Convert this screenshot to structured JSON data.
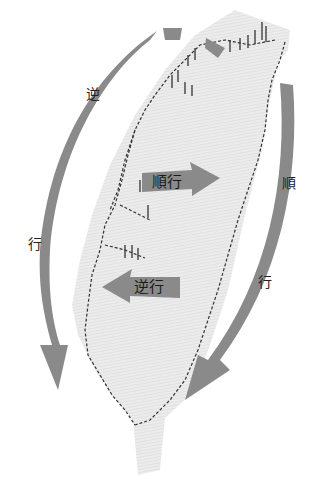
{
  "diagram": {
    "outer_labels": {
      "ccw_char1": "逆",
      "ccw_char2": "行",
      "cw_char1": "順",
      "cw_char2": "行"
    },
    "inner_labels": {
      "clockwise": "順行",
      "counterclockwise": "逆行"
    },
    "colors": {
      "arrow": "#8a8a8a",
      "island": "#e6e6e6",
      "rail": "#333333",
      "background": "#ffffff"
    }
  }
}
